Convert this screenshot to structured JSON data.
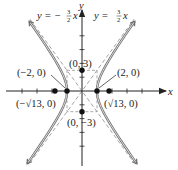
{
  "chart_data": {
    "type": "line",
    "title": "",
    "equation": "x^2/4 - y^2/9 = 1",
    "xlabel": "x",
    "ylabel": "y",
    "xlim": [
      -10,
      11
    ],
    "ylim": [
      -11,
      11
    ],
    "grid": false,
    "x_ticks": [
      -8,
      -6,
      -4,
      -2,
      2,
      4,
      6,
      8
    ],
    "y_ticks": [
      -8,
      -6,
      -4,
      -2,
      2,
      4,
      6,
      8
    ],
    "asymptotes": [
      {
        "name": "y = -3/2 x",
        "slope": -1.5,
        "style": "dashed"
      },
      {
        "name": "y = 3/2 x",
        "slope": 1.5,
        "style": "dashed"
      }
    ],
    "rectangle": {
      "x": [
        -2,
        2
      ],
      "y": [
        -3,
        3
      ],
      "style": "dashed"
    },
    "points": [
      {
        "label": "(0, 3)",
        "x": 0,
        "y": 3
      },
      {
        "label": "(0, -3)",
        "x": 0,
        "y": -3
      },
      {
        "label": "(-2, 0)",
        "x": -2,
        "y": 0
      },
      {
        "label": "(2, 0)",
        "x": 2,
        "y": 0
      },
      {
        "label": "(-√13, 0)",
        "x": -3.606,
        "y": 0
      },
      {
        "label": "(√13, 0)",
        "x": 3.606,
        "y": 0
      }
    ],
    "series": [
      {
        "name": "right branch",
        "a": 2,
        "b": 3,
        "branch": 1
      },
      {
        "name": "left branch",
        "a": 2,
        "b": 3,
        "branch": -1
      }
    ]
  },
  "labels": {
    "x_axis": "x",
    "y_axis": "y",
    "asym_neg": "y = −",
    "asym_pos": "y = ",
    "frac_num": "3",
    "frac_den": "2",
    "asym_x": "x",
    "pt_0_3": "(0, 3)",
    "pt_0_m3": "(0, −3)",
    "pt_m2_0": "(−2, 0)",
    "pt_2_0": "(2, 0)",
    "pt_msqrt13": "(−√13, 0)",
    "pt_sqrt13": "(√13, 0)"
  },
  "colors": {
    "axis": "#222222",
    "curve": "#7a7a7a",
    "dashed": "#9a9a9a",
    "point": "#111111"
  }
}
